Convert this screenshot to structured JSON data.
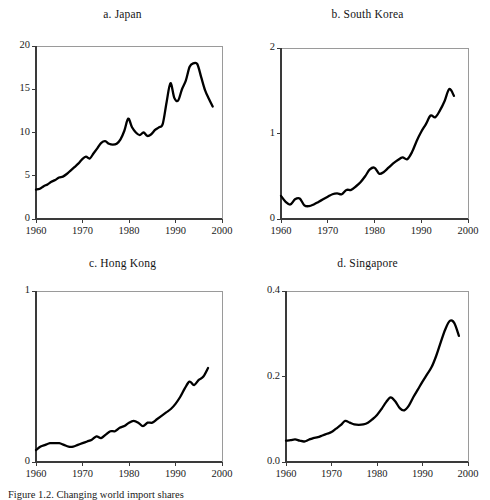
{
  "figure": {
    "caption": "Figure 1.2.  Changing world import shares",
    "panel_count": 4
  },
  "panels": [
    {
      "id": "japan",
      "title": "a.  Japan",
      "yticks": [
        "0",
        "5",
        "10",
        "15",
        "20"
      ],
      "xticks": [
        "1960",
        "1970",
        "1980",
        "1990",
        "2000"
      ]
    },
    {
      "id": "south-korea",
      "title": "b.  South Korea",
      "yticks": [
        "0",
        "1",
        "2"
      ],
      "xticks": [
        "1960",
        "1970",
        "1980",
        "1990",
        "2000"
      ]
    },
    {
      "id": "hong-kong",
      "title": "c.  Hong Kong",
      "yticks": [
        "0",
        "1"
      ],
      "xticks": [
        "1960",
        "1970",
        "1980",
        "1990",
        "2000"
      ]
    },
    {
      "id": "singapore",
      "title": "d.  Singapore",
      "yticks": [
        "0.0",
        "0.2",
        "0.4"
      ],
      "xticks": [
        "1960",
        "1970",
        "1980",
        "1990",
        "2000"
      ]
    }
  ],
  "chart_data": [
    {
      "type": "line",
      "id": "japan",
      "title": "a.  Japan",
      "xlabel": "",
      "ylabel": "",
      "xlim": [
        1960,
        2000
      ],
      "ylim": [
        0,
        20
      ],
      "grid": false,
      "legend": "none",
      "line_color": "#000000",
      "x": [
        1960,
        1961,
        1962,
        1963,
        1964,
        1965,
        1966,
        1967,
        1968,
        1969,
        1970,
        1971,
        1972,
        1973,
        1974,
        1975,
        1976,
        1977,
        1978,
        1979,
        1980,
        1981,
        1982,
        1983,
        1984,
        1985,
        1986,
        1987,
        1988,
        1989,
        1990,
        1991,
        1992,
        1993,
        1994,
        1995,
        1996,
        1997,
        1998
      ],
      "values": [
        3.4,
        3.5,
        3.8,
        4.0,
        4.3,
        4.5,
        4.8,
        4.9,
        5.2,
        5.6,
        6.0,
        6.4,
        6.9,
        7.2,
        7.0,
        7.6,
        8.2,
        8.8,
        9.0,
        8.7,
        8.6,
        8.7,
        9.2,
        10.2,
        11.6,
        10.6,
        10.0,
        9.7,
        10.0,
        9.6,
        9.8,
        10.3,
        10.6,
        11.0,
        13.5,
        15.7,
        14.0,
        13.7,
        15.0,
        16.0,
        17.6,
        18.0,
        17.9,
        16.4,
        14.9,
        13.9,
        13.0
      ]
    },
    {
      "type": "line",
      "id": "south-korea",
      "title": "b.  South Korea",
      "xlabel": "",
      "ylabel": "",
      "xlim": [
        1960,
        2000
      ],
      "ylim": [
        0,
        2
      ],
      "grid": false,
      "legend": "none",
      "line_color": "#000000",
      "x": [
        1960,
        1961,
        1962,
        1963,
        1964,
        1965,
        1966,
        1967,
        1968,
        1969,
        1970,
        1971,
        1972,
        1973,
        1974,
        1975,
        1976,
        1977,
        1978,
        1979,
        1980,
        1981,
        1982,
        1983,
        1984,
        1985,
        1986,
        1987,
        1988,
        1989,
        1990,
        1991,
        1992,
        1993,
        1994,
        1995,
        1996,
        1997
      ],
      "values": [
        0.27,
        0.2,
        0.17,
        0.23,
        0.24,
        0.16,
        0.15,
        0.17,
        0.2,
        0.23,
        0.26,
        0.29,
        0.3,
        0.29,
        0.34,
        0.34,
        0.38,
        0.43,
        0.5,
        0.58,
        0.6,
        0.53,
        0.55,
        0.6,
        0.65,
        0.69,
        0.72,
        0.7,
        0.78,
        0.91,
        1.02,
        1.11,
        1.21,
        1.19,
        1.27,
        1.38,
        1.52,
        1.44
      ]
    },
    {
      "type": "line",
      "id": "hong-kong",
      "title": "c.  Hong Kong",
      "xlabel": "",
      "ylabel": "",
      "xlim": [
        1960,
        2000
      ],
      "ylim": [
        0,
        1
      ],
      "grid": false,
      "legend": "none",
      "line_color": "#000000",
      "x": [
        1960,
        1961,
        1962,
        1963,
        1964,
        1965,
        1966,
        1967,
        1968,
        1969,
        1970,
        1971,
        1972,
        1973,
        1974,
        1975,
        1976,
        1977,
        1978,
        1979,
        1980,
        1981,
        1982,
        1983,
        1984,
        1985,
        1986,
        1987,
        1988,
        1989,
        1990,
        1991,
        1992,
        1993,
        1994,
        1995,
        1996,
        1997
      ],
      "values": [
        0.07,
        0.09,
        0.1,
        0.11,
        0.11,
        0.11,
        0.1,
        0.09,
        0.09,
        0.1,
        0.11,
        0.12,
        0.13,
        0.15,
        0.14,
        0.16,
        0.18,
        0.18,
        0.2,
        0.21,
        0.23,
        0.24,
        0.23,
        0.21,
        0.23,
        0.23,
        0.25,
        0.27,
        0.29,
        0.31,
        0.34,
        0.38,
        0.43,
        0.47,
        0.45,
        0.48,
        0.5,
        0.55
      ]
    },
    {
      "type": "line",
      "id": "singapore",
      "title": "d.  Singapore",
      "xlabel": "",
      "ylabel": "",
      "xlim": [
        1960,
        2000
      ],
      "ylim": [
        0,
        0.4
      ],
      "grid": false,
      "legend": "none",
      "line_color": "#000000",
      "x": [
        1960,
        1961,
        1962,
        1963,
        1964,
        1965,
        1966,
        1967,
        1968,
        1969,
        1970,
        1971,
        1972,
        1973,
        1974,
        1975,
        1976,
        1977,
        1978,
        1979,
        1980,
        1981,
        1982,
        1983,
        1984,
        1985,
        1986,
        1987,
        1988,
        1989,
        1990,
        1991,
        1992,
        1993,
        1994,
        1995,
        1996,
        1997,
        1998
      ],
      "values": [
        0.05,
        0.051,
        0.053,
        0.05,
        0.048,
        0.052,
        0.056,
        0.058,
        0.062,
        0.066,
        0.07,
        0.078,
        0.086,
        0.096,
        0.092,
        0.088,
        0.087,
        0.088,
        0.092,
        0.1,
        0.11,
        0.124,
        0.14,
        0.151,
        0.142,
        0.126,
        0.121,
        0.132,
        0.152,
        0.17,
        0.188,
        0.205,
        0.222,
        0.248,
        0.28,
        0.31,
        0.33,
        0.325,
        0.295
      ]
    }
  ]
}
